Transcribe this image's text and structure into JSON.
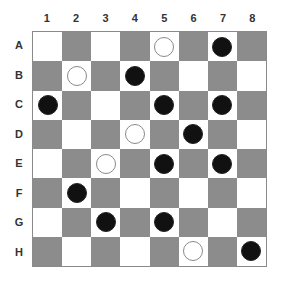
{
  "board": {
    "columns": [
      "1",
      "2",
      "3",
      "4",
      "5",
      "6",
      "7",
      "8"
    ],
    "rows": [
      "A",
      "B",
      "C",
      "D",
      "E",
      "F",
      "G",
      "H"
    ],
    "colors": {
      "light": "#ffffff",
      "dark": "#8c8c8c",
      "black_piece": "#111111",
      "white_piece": "#ffffff"
    },
    "pieces": [
      {
        "row": "A",
        "col": 5,
        "color": "white"
      },
      {
        "row": "A",
        "col": 7,
        "color": "black"
      },
      {
        "row": "B",
        "col": 2,
        "color": "white"
      },
      {
        "row": "B",
        "col": 4,
        "color": "black"
      },
      {
        "row": "C",
        "col": 1,
        "color": "black"
      },
      {
        "row": "C",
        "col": 5,
        "color": "black"
      },
      {
        "row": "C",
        "col": 7,
        "color": "black"
      },
      {
        "row": "D",
        "col": 4,
        "color": "white"
      },
      {
        "row": "D",
        "col": 6,
        "color": "black"
      },
      {
        "row": "E",
        "col": 3,
        "color": "white"
      },
      {
        "row": "E",
        "col": 5,
        "color": "black"
      },
      {
        "row": "E",
        "col": 7,
        "color": "black"
      },
      {
        "row": "F",
        "col": 2,
        "color": "black"
      },
      {
        "row": "G",
        "col": 3,
        "color": "black"
      },
      {
        "row": "G",
        "col": 5,
        "color": "black"
      },
      {
        "row": "H",
        "col": 6,
        "color": "white"
      },
      {
        "row": "H",
        "col": 8,
        "color": "black"
      }
    ]
  }
}
